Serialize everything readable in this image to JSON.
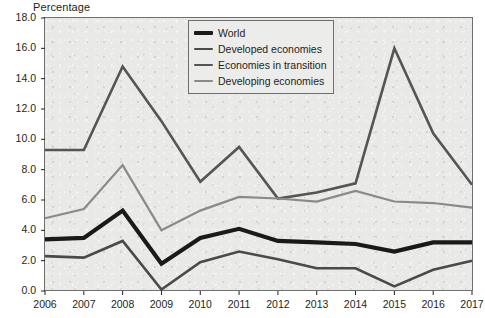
{
  "chart_title": "Percentage",
  "legend": {
    "entries": [
      {
        "label": "World",
        "color": "#1a1a1a",
        "width": 4.2,
        "name": "legend-item-world"
      },
      {
        "label": "Developed economies",
        "color": "#4a4a4a",
        "width": 2.6,
        "name": "legend-item-developed-economies"
      },
      {
        "label": "Economies in transition",
        "color": "#555555",
        "width": 2.6,
        "name": "legend-item-economies-in-transition"
      },
      {
        "label": "Developing economies",
        "color": "#8a8a8a",
        "width": 2.2,
        "name": "legend-item-developing-economies"
      }
    ]
  },
  "axes": {
    "y_ticks": [
      "18.0",
      "16.0",
      "14.0",
      "12.0",
      "10.0",
      "8.0",
      "6.0",
      "4.0",
      "2.0",
      "0.0"
    ],
    "x_ticks": [
      "2006",
      "2007",
      "2008",
      "2009",
      "2010",
      "2011",
      "2012",
      "2013",
      "2014",
      "2015",
      "2016",
      "2017"
    ]
  },
  "chart_data": {
    "type": "line",
    "title": "Percentage",
    "xlabel": "",
    "ylabel": "Percentage",
    "ylim": [
      0.0,
      18.0
    ],
    "ytick_step": 2.0,
    "grid": false,
    "legend_position": "top-center",
    "x": [
      2006,
      2007,
      2008,
      2009,
      2010,
      2011,
      2012,
      2013,
      2014,
      2015,
      2016,
      2017
    ],
    "series": [
      {
        "name": "World",
        "color": "#1a1a1a",
        "line_width": 4.2,
        "values": [
          3.4,
          3.5,
          5.3,
          1.8,
          3.5,
          4.1,
          3.3,
          3.2,
          3.1,
          2.6,
          3.2,
          3.2
        ]
      },
      {
        "name": "Developed economies",
        "color": "#4a4a4a",
        "line_width": 2.6,
        "values": [
          2.3,
          2.2,
          3.3,
          0.1,
          1.9,
          2.6,
          2.1,
          1.5,
          1.5,
          0.3,
          1.4,
          2.0
        ]
      },
      {
        "name": "Economies in transition",
        "color": "#555555",
        "line_width": 2.6,
        "values": [
          9.3,
          9.3,
          14.8,
          11.2,
          7.2,
          9.5,
          6.1,
          6.5,
          7.1,
          16.0,
          10.4,
          7.0
        ]
      },
      {
        "name": "Developing economies",
        "color": "#8a8a8a",
        "line_width": 2.2,
        "values": [
          4.8,
          5.4,
          8.3,
          4.0,
          5.3,
          6.2,
          6.1,
          5.9,
          6.6,
          5.9,
          5.8,
          5.5
        ]
      }
    ]
  }
}
